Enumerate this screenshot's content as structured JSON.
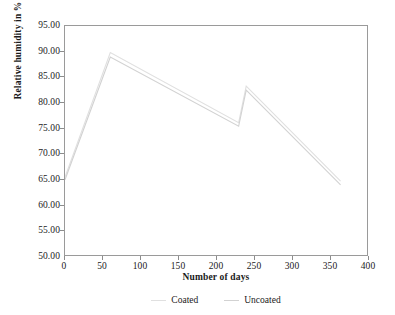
{
  "chart_data": {
    "type": "line",
    "title": "",
    "xlabel": "Number of days",
    "ylabel": "Relative humidity in %",
    "xlim": [
      0,
      400
    ],
    "ylim": [
      50.0,
      95.0
    ],
    "xticks": [
      0,
      50,
      100,
      150,
      200,
      250,
      300,
      350,
      400
    ],
    "xtick_labels": [
      "0",
      "50",
      "100",
      "150",
      "200",
      "250",
      "300",
      "350",
      "400"
    ],
    "yticks": [
      50.0,
      55.0,
      60.0,
      65.0,
      70.0,
      75.0,
      80.0,
      85.0,
      90.0,
      95.0
    ],
    "ytick_labels": [
      "50.00",
      "55.00",
      "60.00",
      "65.00",
      "70.00",
      "75.00",
      "80.00",
      "85.00",
      "90.00",
      "95.00"
    ],
    "grid": false,
    "legend_position": "below",
    "frame": true,
    "series": [
      {
        "name": "Coated",
        "color": "#e0e0e0",
        "x": [
          0,
          60,
          230,
          240,
          365
        ],
        "values": [
          65.3,
          89.8,
          76.0,
          83.2,
          64.5
        ]
      },
      {
        "name": "Uncoated",
        "color": "#d2d2d2",
        "x": [
          0,
          60,
          230,
          240,
          365
        ],
        "values": [
          64.8,
          88.9,
          75.3,
          82.4,
          63.8
        ]
      }
    ]
  },
  "axes": {
    "y_title": "Relative humidity in %",
    "x_title": "Number of days"
  },
  "legend": {
    "entries": [
      {
        "label": "Coated"
      },
      {
        "label": "Uncoated"
      }
    ]
  }
}
